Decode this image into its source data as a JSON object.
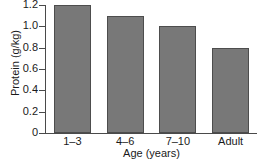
{
  "chart_data": {
    "type": "bar",
    "title": "",
    "subtitle": "",
    "xlabel": "Age (years)",
    "ylabel": "Protein (g/kg)",
    "categories": [
      "1–3",
      "4–6",
      "7–10",
      "Adult"
    ],
    "values": [
      1.2,
      1.1,
      1.0,
      0.8
    ],
    "series": [
      {
        "name": "Protein requirement",
        "values": [
          1.2,
          1.1,
          1.0,
          0.8
        ]
      }
    ],
    "ylim": [
      0,
      1.2
    ],
    "yticks": [
      0,
      0.2,
      0.4,
      0.6,
      0.8,
      1.0,
      1.2
    ],
    "ytick_labels": [
      "0",
      "0.2",
      "0.4",
      "0.6",
      "0.8",
      "1.0",
      "1.2"
    ],
    "grid": false,
    "legend": false,
    "legend_position": "none",
    "annotations": [],
    "colors": {
      "bar_fill": "#787878",
      "bar_edge": "#4d4d4d",
      "axis": "#4a4a4a",
      "text": "#1a1a1a",
      "background": "#ffffff"
    }
  }
}
